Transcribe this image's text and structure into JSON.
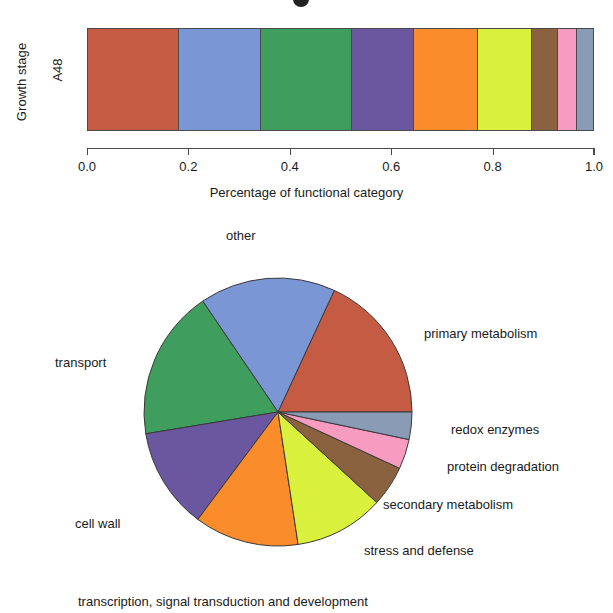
{
  "chart_data": [
    {
      "type": "bar",
      "orientation": "horizontal",
      "stacked": true,
      "normalized": true,
      "title": "",
      "xlabel": "Percentage of functional category",
      "ylabel": "Growth stage",
      "categories": [
        "A48"
      ],
      "xlim": [
        0.0,
        1.0
      ],
      "xticks": [
        "0.0",
        "0.2",
        "0.4",
        "0.6",
        "0.8",
        "1.0"
      ],
      "xtick_values": [
        0.0,
        0.2,
        0.4,
        0.6,
        0.8,
        1.0
      ],
      "grid": false,
      "legend": "none",
      "series": [
        {
          "name": "primary metabolism",
          "value": 0.181,
          "color": "#C65B43"
        },
        {
          "name": "other",
          "value": 0.164,
          "color": "#7B96D4"
        },
        {
          "name": "transport",
          "value": 0.181,
          "color": "#3F9E5E"
        },
        {
          "name": "cell wall",
          "value": 0.122,
          "color": "#6B56A0"
        },
        {
          "name": "transcription, signal transduction and development",
          "value": 0.126,
          "color": "#FA8C2B"
        },
        {
          "name": "stress and defense",
          "value": 0.108,
          "color": "#D9F03C"
        },
        {
          "name": "secondary metabolism",
          "value": 0.049,
          "color": "#8B6240"
        },
        {
          "name": "protein degradation",
          "value": 0.036,
          "color": "#F79BC0"
        },
        {
          "name": "redox enzymes",
          "value": 0.033,
          "color": "#8A9BB5"
        }
      ]
    },
    {
      "type": "pie",
      "title": "",
      "start_angle_deg": 0,
      "direction": "counterclockwise",
      "labels": [
        "primary metabolism",
        "other",
        "transport",
        "cell wall",
        "transcription, signal transduction and development",
        "stress and defense",
        "secondary metabolism",
        "protein degradation",
        "redox enzymes"
      ],
      "values": [
        0.181,
        0.164,
        0.181,
        0.122,
        0.126,
        0.108,
        0.049,
        0.036,
        0.033
      ],
      "colors": [
        "#C65B43",
        "#7B96D4",
        "#3F9E5E",
        "#6B56A0",
        "#FA8C2B",
        "#D9F03C",
        "#8B6240",
        "#F79BC0",
        "#8A9BB5"
      ],
      "label_positions": [
        {
          "label": "primary metabolism",
          "x": 424,
          "y": 326
        },
        {
          "label": "other",
          "x": 226,
          "y": 228
        },
        {
          "label": "transport",
          "x": 55,
          "y": 355
        },
        {
          "label": "cell wall",
          "x": 75,
          "y": 516
        },
        {
          "label": "transcription, signal transduction and development",
          "x": 78,
          "y": 594
        },
        {
          "label": "stress and defense",
          "x": 364,
          "y": 543
        },
        {
          "label": "secondary metabolism",
          "x": 383,
          "y": 497
        },
        {
          "label": "protein degradation",
          "x": 447,
          "y": 459
        },
        {
          "label": "redox enzymes",
          "x": 451,
          "y": 422
        }
      ]
    }
  ],
  "bar_chart": {
    "ylabel": "Growth stage",
    "ytick": "A48",
    "xlabel": "Percentage of functional category",
    "xticks": [
      "0.0",
      "0.2",
      "0.4",
      "0.6",
      "0.8",
      "1.0"
    ]
  },
  "pie_chart": {
    "labels": {
      "primary_metabolism": "primary metabolism",
      "other": "other",
      "transport": "transport",
      "cell_wall": "cell wall",
      "transcription": "transcription, signal transduction and development",
      "stress_defense": "stress and defense",
      "secondary_metabolism": "secondary metabolism",
      "protein_degradation": "protein degradation",
      "redox_enzymes": "redox enzymes"
    }
  }
}
